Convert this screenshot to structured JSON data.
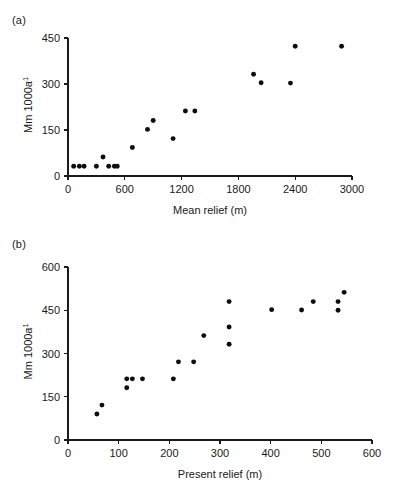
{
  "figure": {
    "panel_a_label": "(a)",
    "panel_b_label": "(b)",
    "point_color": "#0d0d0d",
    "axis_color": "#1a1a1a",
    "background": "#ffffff"
  },
  "chart_data": [
    {
      "type": "scatter",
      "panel": "(a)",
      "title": "",
      "xlabel": "Mean relief (m)",
      "ylabel": "Mm 1000a",
      "ylabel_exponent": "-1",
      "xlim": [
        0,
        3000
      ],
      "ylim": [
        0,
        450
      ],
      "xticks": [
        0,
        600,
        1200,
        1800,
        2400,
        3000
      ],
      "yticks": [
        0,
        150,
        300,
        450
      ],
      "grid": false,
      "legend": "none",
      "points": [
        {
          "x": 60,
          "y": 32
        },
        {
          "x": 120,
          "y": 32
        },
        {
          "x": 170,
          "y": 32
        },
        {
          "x": 300,
          "y": 32
        },
        {
          "x": 370,
          "y": 62
        },
        {
          "x": 430,
          "y": 32
        },
        {
          "x": 490,
          "y": 32
        },
        {
          "x": 520,
          "y": 32
        },
        {
          "x": 680,
          "y": 93
        },
        {
          "x": 840,
          "y": 152
        },
        {
          "x": 900,
          "y": 181
        },
        {
          "x": 1110,
          "y": 122
        },
        {
          "x": 1240,
          "y": 212
        },
        {
          "x": 1340,
          "y": 212
        },
        {
          "x": 1960,
          "y": 332
        },
        {
          "x": 2040,
          "y": 304
        },
        {
          "x": 2350,
          "y": 303
        },
        {
          "x": 2400,
          "y": 423
        },
        {
          "x": 2890,
          "y": 423
        }
      ]
    },
    {
      "type": "scatter",
      "panel": "(b)",
      "title": "",
      "xlabel": "Present relief (m)",
      "ylabel": "Mm 1000a",
      "ylabel_exponent": "-1",
      "xlim": [
        0,
        600
      ],
      "ylim": [
        0,
        600
      ],
      "xticks": [
        0,
        100,
        200,
        300,
        400,
        500,
        600
      ],
      "yticks": [
        0,
        150,
        300,
        450,
        600
      ],
      "grid": false,
      "legend": "none",
      "points": [
        {
          "x": 57,
          "y": 90
        },
        {
          "x": 67,
          "y": 121
        },
        {
          "x": 116,
          "y": 212
        },
        {
          "x": 116,
          "y": 181
        },
        {
          "x": 127,
          "y": 212
        },
        {
          "x": 147,
          "y": 212
        },
        {
          "x": 208,
          "y": 212
        },
        {
          "x": 218,
          "y": 271
        },
        {
          "x": 248,
          "y": 271
        },
        {
          "x": 268,
          "y": 362
        },
        {
          "x": 318,
          "y": 480
        },
        {
          "x": 318,
          "y": 392
        },
        {
          "x": 318,
          "y": 332
        },
        {
          "x": 402,
          "y": 452
        },
        {
          "x": 461,
          "y": 451
        },
        {
          "x": 484,
          "y": 480
        },
        {
          "x": 533,
          "y": 480
        },
        {
          "x": 533,
          "y": 450
        },
        {
          "x": 545,
          "y": 512
        }
      ]
    }
  ]
}
